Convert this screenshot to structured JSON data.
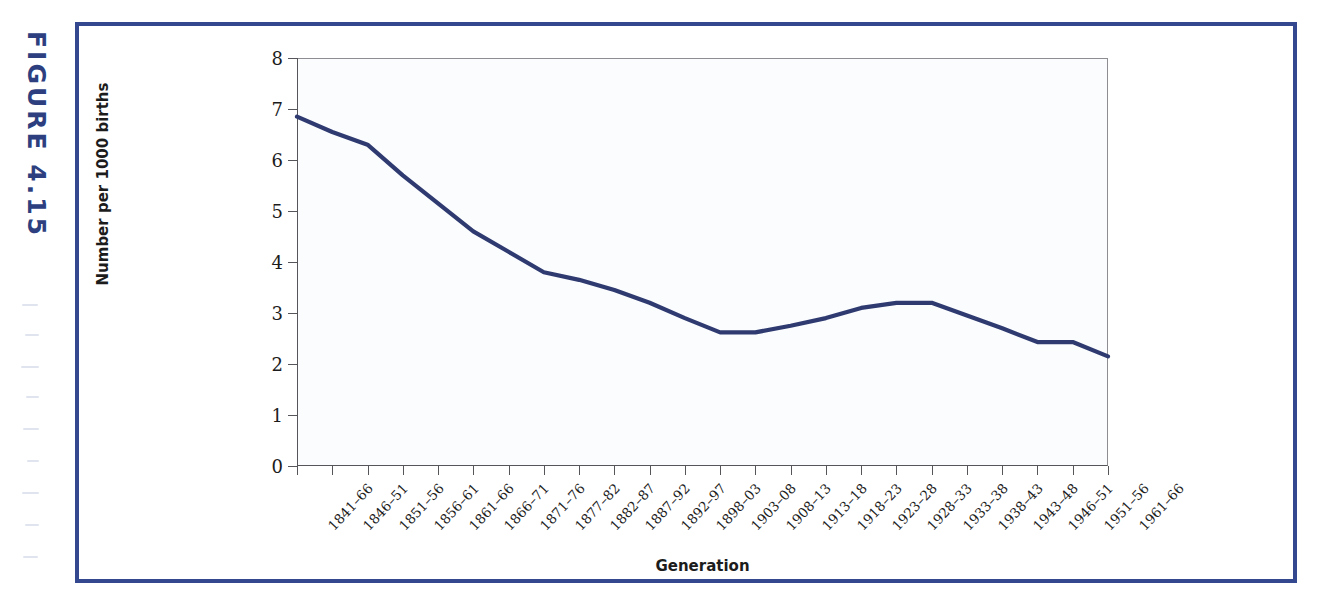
{
  "figure": {
    "label": "FIGURE 4.15"
  },
  "colors": {
    "frame_border": "#33488f",
    "line": "#2e3a70",
    "plot_background": "#fbfcfe",
    "axis": "#55555a",
    "text": "#1c1c1c"
  },
  "chart_data": {
    "type": "line",
    "title": "",
    "xlabel": "Generation",
    "ylabel": "Number per 1000 births",
    "ylim": [
      0,
      8
    ],
    "yticks": [
      0,
      1,
      2,
      3,
      4,
      5,
      6,
      7,
      8
    ],
    "grid": false,
    "legend": null,
    "categories": [
      "1841–66",
      "1846–51",
      "1851–56",
      "1856–61",
      "1861–66",
      "1866–71",
      "1871–76",
      "1877–82",
      "1882–87",
      "1887–92",
      "1892–97",
      "1898–03",
      "1903–08",
      "1908–13",
      "1913–18",
      "1918–23",
      "1923–28",
      "1928–33",
      "1933–38",
      "1938–43",
      "1943–48",
      "1946–51",
      "1951–56",
      "1961–66"
    ],
    "values": [
      6.85,
      6.55,
      6.3,
      5.7,
      5.15,
      4.6,
      4.2,
      3.8,
      3.65,
      3.45,
      3.2,
      2.9,
      2.62,
      2.62,
      2.75,
      2.9,
      3.1,
      3.2,
      3.2,
      2.95,
      2.7,
      2.43,
      2.43,
      2.15
    ],
    "series": [
      {
        "name": "Number per 1000 births",
        "values": [
          6.85,
          6.55,
          6.3,
          5.7,
          5.15,
          4.6,
          4.2,
          3.8,
          3.65,
          3.45,
          3.2,
          2.9,
          2.62,
          2.62,
          2.75,
          2.9,
          3.1,
          3.2,
          3.2,
          2.95,
          2.7,
          2.43,
          2.43,
          2.15
        ],
        "color": "#2e3a70"
      }
    ]
  }
}
